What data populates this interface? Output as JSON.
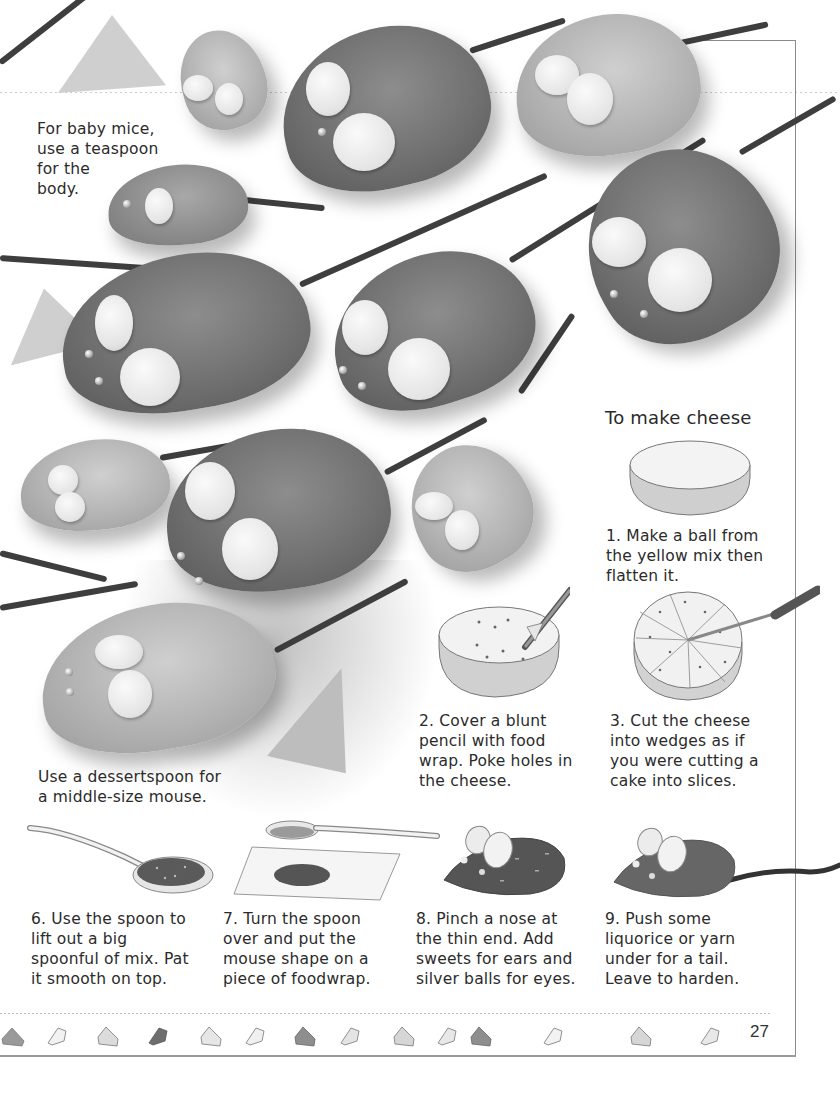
{
  "page": {
    "page_number": "27",
    "section_heading": "To make cheese"
  },
  "photo_captions": {
    "baby_mice": [
      "For baby mice,",
      "use a teaspoon",
      "for the",
      "body."
    ],
    "middle_mouse": [
      "Use a dessertspoon for",
      "a middle-size mouse."
    ]
  },
  "cheese_steps": [
    {
      "number": "1.",
      "lines": [
        "1. Make a ball from",
        "the yellow mix then",
        "flatten it."
      ],
      "illustration": "flat-cheese-disc"
    },
    {
      "number": "2.",
      "lines": [
        "2. Cover a blunt",
        "pencil with food",
        "wrap. Poke holes in",
        "the cheese."
      ],
      "illustration": "pencil-poking-cheese"
    },
    {
      "number": "3.",
      "lines": [
        "3. Cut the cheese",
        "into wedges as if",
        "you were cutting a",
        "cake into slices."
      ],
      "illustration": "knife-cutting-cheese-wedges"
    }
  ],
  "mouse_steps": [
    {
      "number": "6.",
      "lines": [
        "6. Use the spoon to",
        "lift out a big",
        "spoonful of mix. Pat",
        "it smooth on top."
      ],
      "illustration": "spoon-with-mix"
    },
    {
      "number": "7.",
      "lines": [
        "7. Turn the spoon",
        "over and put the",
        "mouse shape on a",
        "piece of foodwrap."
      ],
      "illustration": "spoon-and-foodwrap"
    },
    {
      "number": "8.",
      "lines": [
        "8. Pinch a nose at",
        "the thin end. Add",
        "sweets for ears and",
        "silver balls for eyes."
      ],
      "illustration": "mouse-with-ears"
    },
    {
      "number": "9.",
      "lines": [
        "9. Push some",
        "liquorice or yarn",
        "under for a tail.",
        "Leave to harden."
      ],
      "illustration": "mouse-with-tail"
    }
  ],
  "footer": {
    "wedge_icons": [
      "cheese-wedge-icon",
      "cheese-wedge-icon",
      "cheese-wedge-icon",
      "cheese-wedge-icon",
      "cheese-wedge-icon",
      "cheese-wedge-icon",
      "cheese-wedge-icon",
      "cheese-wedge-icon",
      "cheese-wedge-icon",
      "cheese-wedge-icon"
    ],
    "wedge_shades": [
      "#9a9a9a",
      "#f2f2f2",
      "#dcdcdc",
      "#6e6e6e",
      "#e6e6e6",
      "#f0f0f0",
      "#8e8e8e",
      "#e4e4e4",
      "#d6d6d6",
      "#e8e8e8"
    ]
  },
  "colors": {
    "text": "#2b2b2b",
    "frame": "#8a8a8a",
    "mouse_dark": "#6f6f6f",
    "mouse_light": "#b2b2b2"
  }
}
